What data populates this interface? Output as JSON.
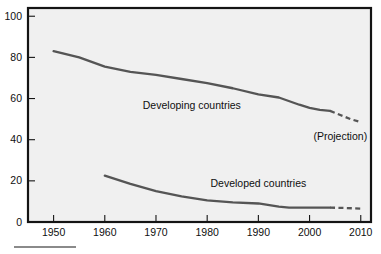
{
  "chart_data": {
    "type": "line",
    "title": "",
    "subtitle": "",
    "xlabel": "",
    "ylabel": "",
    "xlim": [
      1945,
      2012
    ],
    "ylim": [
      0,
      104
    ],
    "grid": false,
    "legend_position": "inline-annotation",
    "x_ticks": [
      1950,
      1960,
      1970,
      1980,
      1990,
      2000,
      2010
    ],
    "x_tick_labels": [
      "1950",
      "1960",
      "1970",
      "1980",
      "1990",
      "2000",
      "2010"
    ],
    "y_ticks": [
      0,
      20,
      40,
      60,
      80,
      100
    ],
    "y_tick_labels": [
      "0",
      "20",
      "40",
      "60",
      "80",
      "100"
    ],
    "series": [
      {
        "name": "Developing countries",
        "label": "Developing countries",
        "label_x": 1977,
        "label_y": 55,
        "color": "#555555",
        "x": [
          1950,
          1955,
          1960,
          1965,
          1970,
          1975,
          1980,
          1985,
          1990,
          1994,
          1998,
          2000,
          2002,
          2004
        ],
        "values": [
          83,
          80,
          75.5,
          73,
          71.5,
          69.5,
          67.5,
          65,
          62,
          60.5,
          57,
          55.5,
          54.5,
          54
        ],
        "projection_x": [
          2004,
          2006,
          2008,
          2010
        ],
        "projection_values": [
          54,
          52,
          50,
          48.5
        ],
        "style": "solid-then-dashed"
      },
      {
        "name": "Developed countries",
        "label": "Developed countries",
        "label_x": 1990,
        "label_y": 17,
        "color": "#555555",
        "x": [
          1960,
          1965,
          1970,
          1975,
          1980,
          1985,
          1990,
          1994,
          1996,
          2000,
          2004
        ],
        "values": [
          22.5,
          18.5,
          15,
          12.5,
          10.5,
          9.5,
          9,
          7.5,
          7,
          7,
          7
        ],
        "projection_x": [
          2004,
          2007,
          2010
        ],
        "projection_values": [
          7,
          6.8,
          6.5
        ],
        "style": "solid-then-dashed"
      }
    ],
    "annotations": [
      {
        "text": "(Projection)",
        "x": 2006,
        "y": 40,
        "name": "projection-annotation"
      }
    ]
  },
  "footer": {
    "rule": ""
  }
}
